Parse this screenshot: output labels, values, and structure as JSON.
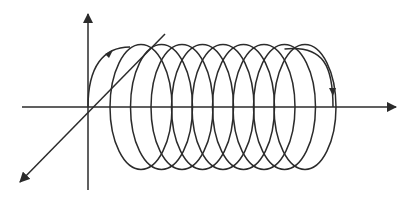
{
  "figure": {
    "stroke_color": "#2b2b2b",
    "background": "#ffffff",
    "axes": {
      "origin": [
        88,
        107
      ],
      "vertical": {
        "from": [
          88,
          190
        ],
        "to": [
          88,
          14
        ]
      },
      "horizontal": {
        "from": [
          22,
          107
        ],
        "to": [
          396,
          107
        ]
      },
      "diagonal": {
        "from": [
          165,
          34
        ],
        "to": [
          20,
          182
        ]
      }
    },
    "helix": {
      "loop_count": 10,
      "top_y": 47,
      "bottom_y": 172,
      "center_y": 107,
      "loop_spacing": 20.5,
      "start_x": 88,
      "end_x": 333,
      "direction_arrows": [
        "start-arc",
        "end-arc"
      ]
    }
  }
}
